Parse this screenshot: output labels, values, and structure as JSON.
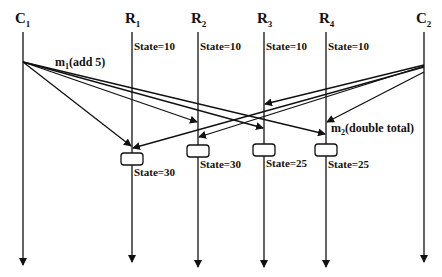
{
  "diagram": {
    "processes": [
      {
        "id": "C1",
        "base": "C",
        "sub": "1",
        "x": 23
      },
      {
        "id": "R1",
        "base": "R",
        "sub": "1",
        "x": 132
      },
      {
        "id": "R2",
        "base": "R",
        "sub": "2",
        "x": 198
      },
      {
        "id": "R3",
        "base": "R",
        "sub": "3",
        "x": 264
      },
      {
        "id": "R4",
        "base": "R",
        "sub": "4",
        "x": 326
      },
      {
        "id": "C2",
        "base": "C",
        "sub": "2",
        "x": 424
      }
    ],
    "initial_states": [
      "State=10",
      "State=10",
      "State=10",
      "State=10"
    ],
    "final_states": [
      "State=30",
      "State=30",
      "State=25",
      "State=25"
    ],
    "messages": {
      "m1": {
        "base": "m",
        "sub": "1",
        "text": "(add 5)"
      },
      "m2": {
        "base": "m",
        "sub": "2",
        "text": "(double total)"
      }
    }
  }
}
